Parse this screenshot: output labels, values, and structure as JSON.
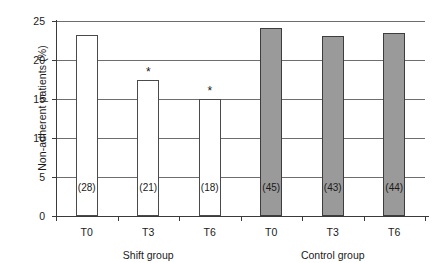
{
  "chart_data": {
    "type": "bar",
    "title": "",
    "xlabel": "",
    "ylabel": "Non-adherent patients (%)",
    "ylim": [
      0,
      25
    ],
    "yticks": [
      0,
      5,
      10,
      15,
      20,
      25
    ],
    "ytick_labels": [
      "0",
      "5",
      "10",
      "15",
      "20",
      "25"
    ],
    "grid": true,
    "legend": "none",
    "categories": [
      "T0",
      "T3",
      "T6",
      "T0",
      "T3",
      "T6"
    ],
    "groups": [
      {
        "name": "Shift group",
        "label": "Shift group",
        "style": "open",
        "categories": [
          "T0",
          "T3",
          "T6"
        ]
      },
      {
        "name": "Control group",
        "label": "Control group",
        "style": "filled",
        "categories": [
          "T0",
          "T3",
          "T6"
        ]
      }
    ],
    "values": [
      23.2,
      17.5,
      15.0,
      24.1,
      23.1,
      23.5
    ],
    "bars": [
      {
        "group": "Shift group",
        "category": "T0",
        "value": 23.2,
        "count_label": "(28)",
        "style": "open",
        "significance": ""
      },
      {
        "group": "Shift group",
        "category": "T3",
        "value": 17.5,
        "count_label": "(21)",
        "style": "open",
        "significance": "*"
      },
      {
        "group": "Shift group",
        "category": "T6",
        "value": 15.0,
        "count_label": "(18)",
        "style": "open",
        "significance": "*"
      },
      {
        "group": "Control group",
        "category": "T0",
        "value": 24.1,
        "count_label": "(45)",
        "style": "filled",
        "significance": ""
      },
      {
        "group": "Control group",
        "category": "T3",
        "value": 23.1,
        "count_label": "(43)",
        "style": "filled",
        "significance": ""
      },
      {
        "group": "Control group",
        "category": "T6",
        "value": 23.5,
        "count_label": "(44)",
        "style": "filled",
        "significance": ""
      }
    ],
    "annotations": [
      "*",
      "*"
    ],
    "colors": {
      "open_bar_fill": "#ffffff",
      "filled_bar_fill": "#9a9a9a",
      "bar_edge": "#4a4a4a",
      "grid": "#6e6e6e",
      "axis": "#3a3a3a",
      "text": "#1a1a1a",
      "background": "#ffffff"
    }
  }
}
